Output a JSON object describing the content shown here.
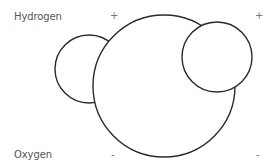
{
  "labels": {
    "top": "Hydrogen",
    "bottom": "Oxygen"
  },
  "marks": {
    "top_left": "+",
    "top_right": "+",
    "bottom_left": "-",
    "bottom_right": "-"
  },
  "colors": {
    "stroke": "#2a2a2a",
    "text": "#555555"
  },
  "circles": [
    {
      "name": "left-small",
      "cx": 89,
      "cy": 69,
      "r": 34
    },
    {
      "name": "large",
      "cx": 164,
      "cy": 86,
      "r": 71
    },
    {
      "name": "right-small",
      "cx": 217,
      "cy": 57,
      "r": 35
    }
  ]
}
